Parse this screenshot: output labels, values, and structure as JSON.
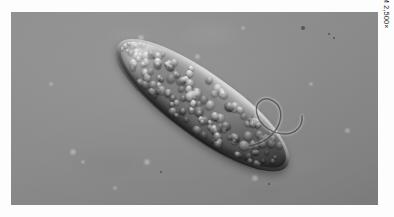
{
  "figure": {
    "magnification_label": "LM 2,500×",
    "photo": {
      "technique": "light micrograph",
      "background_color": "#8a8a8a",
      "page_color": "#ffffff",
      "frame": {
        "x": 11,
        "y": 12,
        "width": 367,
        "height": 193
      }
    },
    "subject": {
      "name": "elongated protozoan cell",
      "description": "sausage-shaped single-celled organism filled with granular vesicles, bright rim highlight on upper-left edge, dark shadow on lower-right edge, long curling flagellum at posterior end",
      "orientation_degrees": 36,
      "body_color_light": "#cfcfcf",
      "body_color_dark": "#2e2e2e",
      "flagellum_color": "#3a3a3a"
    },
    "background_specks": [
      {
        "x": 292,
        "y": 16,
        "r": 2.1,
        "kind": "dark"
      },
      {
        "x": 318,
        "y": 22,
        "r": 1.2,
        "kind": "dark"
      },
      {
        "x": 323,
        "y": 26,
        "r": 1.0,
        "kind": "dark"
      },
      {
        "x": 130,
        "y": 26,
        "r": 1.6,
        "kind": "soft"
      },
      {
        "x": 232,
        "y": 16,
        "r": 1.3,
        "kind": "soft"
      },
      {
        "x": 186,
        "y": 44,
        "r": 1.5,
        "kind": "soft"
      },
      {
        "x": 62,
        "y": 140,
        "r": 2.3,
        "kind": "soft"
      },
      {
        "x": 72,
        "y": 150,
        "r": 1.4,
        "kind": "soft"
      },
      {
        "x": 136,
        "y": 150,
        "r": 2.0,
        "kind": "soft"
      },
      {
        "x": 150,
        "y": 160,
        "r": 1.3,
        "kind": "dark"
      },
      {
        "x": 244,
        "y": 166,
        "r": 1.7,
        "kind": "soft"
      },
      {
        "x": 258,
        "y": 172,
        "r": 1.2,
        "kind": "dark"
      },
      {
        "x": 336,
        "y": 118,
        "r": 1.5,
        "kind": "soft"
      },
      {
        "x": 40,
        "y": 72,
        "r": 1.2,
        "kind": "soft"
      },
      {
        "x": 104,
        "y": 176,
        "r": 1.4,
        "kind": "soft"
      },
      {
        "x": 300,
        "y": 72,
        "r": 1.1,
        "kind": "soft"
      }
    ]
  }
}
